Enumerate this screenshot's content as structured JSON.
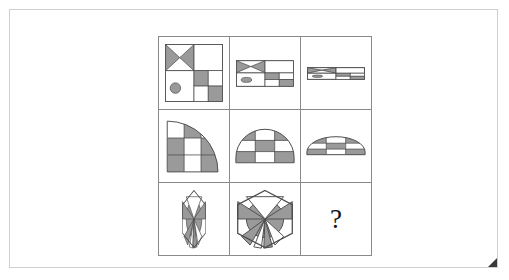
{
  "puzzle": {
    "type": "matrix-reasoning",
    "rows": 3,
    "columns": 3,
    "missing_cell_label": "?",
    "colors": {
      "shade_fill": "#9a9a9a",
      "blank_fill": "#ffffff",
      "stroke": "#4a4a4a",
      "grid_line": "#8a8a8a",
      "page_border": "#cfcfcf",
      "corner_fold": "#3a3a3a",
      "text": "#141414"
    },
    "cells": [
      {
        "id": "r1c1",
        "row": 1,
        "column": 1,
        "figure": "square-quadrants-bowtie-circle-checker",
        "description": "Large square divided into quadrants: shaded bowtie X in upper-left, blank upper-right, shaded circle in lower-left, 2x2 checkerboard in lower-right",
        "scale_x": 1.0,
        "scale_y": 1.0
      },
      {
        "id": "r1c2",
        "row": 1,
        "column": 2,
        "figure": "square-quadrants-bowtie-circle-checker",
        "description": "Same motif compressed vertically to about half height",
        "scale_x": 1.0,
        "scale_y": 0.45
      },
      {
        "id": "r1c3",
        "row": 1,
        "column": 3,
        "figure": "square-quadrants-bowtie-circle-checker",
        "description": "Same motif compressed vertically into a thin horizontal strip",
        "scale_x": 1.0,
        "scale_y": 0.2
      },
      {
        "id": "r2c1",
        "row": 2,
        "column": 1,
        "figure": "quarter-circle-checker",
        "description": "Quarter circle arc opening down-right filled with checkerboard squares",
        "scale_x": 1.0,
        "scale_y": 1.0
      },
      {
        "id": "r2c2",
        "row": 2,
        "column": 2,
        "figure": "half-dome-checker",
        "description": "Half dome arc filled with checkerboard squares",
        "scale_x": 1.0,
        "scale_y": 0.62
      },
      {
        "id": "r2c3",
        "row": 2,
        "column": 3,
        "figure": "flat-dome-checker",
        "description": "Flattened dome arc filled with checkerboard squares",
        "scale_x": 1.0,
        "scale_y": 0.33
      },
      {
        "id": "r3c1",
        "row": 3,
        "column": 1,
        "figure": "hexagon-rays",
        "description": "Hexagon with radiating shaded rays compressed horizontally to a narrow sliver",
        "scale_x": 0.42,
        "scale_y": 1.0
      },
      {
        "id": "r3c2",
        "row": 3,
        "column": 2,
        "figure": "hexagon-rays",
        "description": "Full hexagon with shaded circle and radiating triangular rays",
        "scale_x": 1.0,
        "scale_y": 1.0
      },
      {
        "id": "r3c3",
        "row": 3,
        "column": 3,
        "figure": "missing",
        "description": "Missing answer cell showing a question mark",
        "scale_x": 1.0,
        "scale_y": 1.0
      }
    ]
  }
}
